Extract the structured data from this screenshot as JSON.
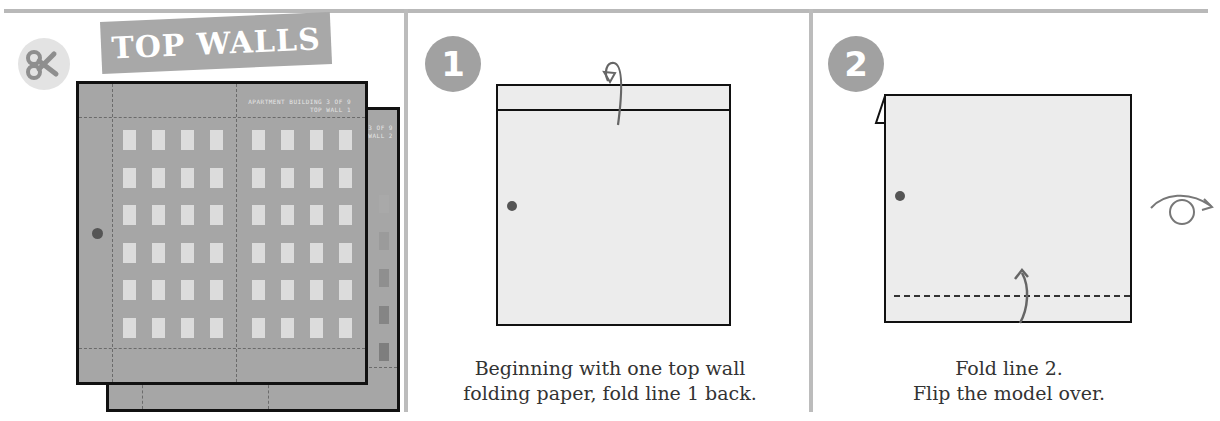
{
  "header": {
    "title": "TOP WALLS",
    "scissors_icon": "scissors-icon"
  },
  "panels": [
    {
      "id": "cut-out",
      "sheet_label_line1": "APARTMENT BUILDING 3 OF 9",
      "sheet_label_line2": "TOP WALL 1",
      "back_sheet_label_line1": "3 OF 9",
      "back_sheet_label_line2": "WALL 2",
      "window_rows": 6,
      "window_cols_per_half": 4
    },
    {
      "id": "step-1",
      "step_number": "1",
      "caption_line1": "Beginning with one top wall",
      "caption_line2": "folding paper, fold line 1 back."
    },
    {
      "id": "step-2",
      "step_number": "2",
      "caption_line1": "Fold line 2.",
      "caption_line2": "Flip the model over.",
      "flip_icon": "flip-over-icon"
    }
  ],
  "colors": {
    "banner": "#a8a8a8",
    "badge": "#a1a1a1",
    "sheet": "#a6a6a6",
    "paper": "#ececec",
    "arrow": "#666666",
    "divider": "#bcbcbc"
  }
}
